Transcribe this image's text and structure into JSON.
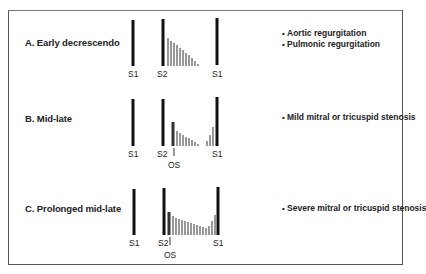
{
  "rows": [
    {
      "id": "A",
      "label": "A. Early decrescendo",
      "label_pos": [
        25,
        43
      ],
      "descriptions": [
        "Aortic regurgitation",
        "Pulmonic regurgitation"
      ],
      "desc_pos": [
        282,
        33
      ],
      "s1_left": {
        "x": 133,
        "y1": 20,
        "y2": 66,
        "label": "S1"
      },
      "s2": {
        "x": 163,
        "y1": 19,
        "y2": 66,
        "label": "S2"
      },
      "s1_right": {
        "x": 217,
        "y1": 18,
        "y2": 65,
        "label": "S1"
      },
      "os": null,
      "murmur_bars": [
        {
          "x": 168,
          "y1": 38
        },
        {
          "x": 171,
          "y1": 41
        },
        {
          "x": 174,
          "y1": 43
        },
        {
          "x": 177,
          "y1": 45
        },
        {
          "x": 180,
          "y1": 48
        },
        {
          "x": 183,
          "y1": 50
        },
        {
          "x": 186,
          "y1": 53
        },
        {
          "x": 189,
          "y1": 55
        },
        {
          "x": 192,
          "y1": 58
        },
        {
          "x": 195,
          "y1": 61
        },
        {
          "x": 198,
          "y1": 64
        }
      ],
      "murmur_base": 66,
      "tick_y": 68
    },
    {
      "id": "B",
      "label": "B. Mid-late",
      "label_pos": [
        25,
        119
      ],
      "descriptions": [
        "Mild mitral or tricuspid stenosis"
      ],
      "desc_pos": [
        282,
        117
      ],
      "s1_left": {
        "x": 133,
        "y1": 99,
        "y2": 146,
        "label": "S1"
      },
      "s2": {
        "x": 163,
        "y1": 99,
        "y2": 146,
        "label": "S2"
      },
      "s1_right": {
        "x": 217,
        "y1": 97,
        "y2": 146,
        "label": "S1"
      },
      "os": {
        "x": 174,
        "label": "OS"
      },
      "murmur_bars": [
        {
          "x": 173,
          "y1": 122,
          "w": 3
        },
        {
          "x": 177,
          "y1": 131
        },
        {
          "x": 180,
          "y1": 133
        },
        {
          "x": 183,
          "y1": 135
        },
        {
          "x": 186,
          "y1": 137
        },
        {
          "x": 189,
          "y1": 138
        },
        {
          "x": 192,
          "y1": 140
        },
        {
          "x": 195,
          "y1": 142
        },
        {
          "x": 198,
          "y1": 144
        },
        {
          "x": 207,
          "y1": 141
        },
        {
          "x": 210,
          "y1": 135
        },
        {
          "x": 213,
          "y1": 127
        }
      ],
      "murmur_base": 146,
      "tick_y": 148
    },
    {
      "id": "C",
      "label": "C. Prolonged mid-late",
      "label_pos": [
        25,
        208
      ],
      "descriptions": [
        "Severe mitral or tricuspid stenosis"
      ],
      "desc_pos": [
        282,
        208
      ],
      "s1_left": {
        "x": 134,
        "y1": 189,
        "y2": 235,
        "label": "S1"
      },
      "s2": {
        "x": 164,
        "y1": 188,
        "y2": 235,
        "label": "S2"
      },
      "s1_right": {
        "x": 218,
        "y1": 187,
        "y2": 235,
        "label": "S1"
      },
      "os": {
        "x": 170,
        "label": "OS"
      },
      "murmur_bars": [
        {
          "x": 169,
          "y1": 212,
          "w": 3
        },
        {
          "x": 173,
          "y1": 216
        },
        {
          "x": 176,
          "y1": 218
        },
        {
          "x": 179,
          "y1": 219
        },
        {
          "x": 182,
          "y1": 220
        },
        {
          "x": 185,
          "y1": 221
        },
        {
          "x": 188,
          "y1": 222
        },
        {
          "x": 191,
          "y1": 223
        },
        {
          "x": 194,
          "y1": 224
        },
        {
          "x": 197,
          "y1": 225
        },
        {
          "x": 200,
          "y1": 226
        },
        {
          "x": 203,
          "y1": 227
        },
        {
          "x": 206,
          "y1": 228
        },
        {
          "x": 209,
          "y1": 226
        },
        {
          "x": 212,
          "y1": 221
        },
        {
          "x": 215,
          "y1": 215
        }
      ],
      "murmur_base": 235,
      "tick_y": 238
    }
  ]
}
